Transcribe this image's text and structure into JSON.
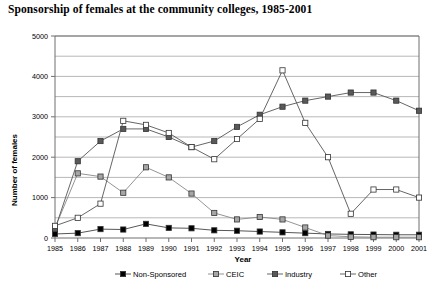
{
  "chart_data": {
    "type": "line",
    "title": "Sponsorship of females at the community colleges, 1985-2001",
    "xlabel": "Year",
    "ylabel": "Number of females",
    "categories": [
      1985,
      1986,
      1987,
      1988,
      1989,
      1990,
      1991,
      1992,
      1993,
      1994,
      1995,
      1996,
      1997,
      1998,
      1999,
      2000,
      2001
    ],
    "xtick_labels": [
      "1985",
      "1986",
      "1987",
      "1988",
      "1989",
      "1990",
      "1991",
      "1992",
      "1993",
      "1994",
      "1995",
      "1996",
      "1997",
      "1998",
      "1999",
      "2000",
      "2001"
    ],
    "ytick_labels": [
      "0",
      "1000",
      "2000",
      "3000",
      "4000",
      "5000"
    ],
    "ylim": [
      0,
      5000
    ],
    "ytick_step": 1000,
    "yminor_step": 500,
    "grid": "horizontal",
    "legend_position": "bottom",
    "series": [
      {
        "name": "Non-Sponsored",
        "marker": "filled-square",
        "color": "#000000",
        "line_color": "#444444",
        "values": [
          100,
          120,
          220,
          210,
          350,
          250,
          240,
          190,
          180,
          160,
          140,
          120,
          100,
          90,
          85,
          80,
          80
        ]
      },
      {
        "name": "CEIC",
        "marker": "light-gray-square",
        "color": "#a6a6a6",
        "line_color": "#888888",
        "values": [
          250,
          1600,
          1520,
          1120,
          1750,
          1500,
          1100,
          620,
          460,
          520,
          460,
          260,
          60,
          30,
          20,
          20,
          20
        ]
      },
      {
        "name": "Industry",
        "marker": "dark-gray-square",
        "color": "#595959",
        "line_color": "#555555",
        "values": [
          220,
          1900,
          2400,
          2700,
          2700,
          2500,
          2250,
          2400,
          2750,
          3050,
          3250,
          3400,
          3500,
          3600,
          3600,
          3400,
          3150
        ]
      },
      {
        "name": "Other",
        "marker": "open-square",
        "color": "#ffffff",
        "line_color": "#555555",
        "values": [
          300,
          500,
          850,
          2900,
          2800,
          2600,
          2250,
          1950,
          2450,
          2950,
          4150,
          2850,
          2000,
          600,
          1200,
          1200,
          1000
        ]
      }
    ]
  }
}
